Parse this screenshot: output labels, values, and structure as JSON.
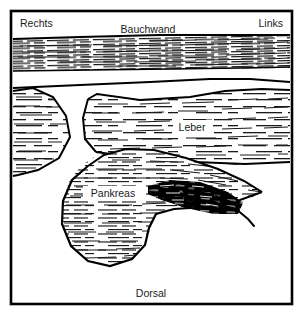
{
  "figure": {
    "kind": "anatomical-schematic",
    "language": "de",
    "colors": {
      "background": "#ffffff",
      "outline": "#000000",
      "hatch": "#1a1a1a",
      "mass_fill": "#000000",
      "text": "#1a1a1a"
    },
    "frame": {
      "x": 11,
      "y": 11,
      "width": 281,
      "height": 293,
      "stroke_width": 2.6
    }
  },
  "labels": {
    "orientation_right": "Rechts",
    "orientation_left": "Links",
    "top_structure": "Bauchwand",
    "bottom_structure": "Dorsal",
    "organ_liver": "Leber",
    "organ_pancreas": "Pankreas"
  },
  "label_positions": {
    "orientation_right": {
      "x": 20,
      "y": 24
    },
    "orientation_left": {
      "x": 283,
      "y": 24
    },
    "top_structure": {
      "x": 148,
      "y": 30
    },
    "bottom_structure": {
      "x": 151,
      "y": 294
    },
    "organ_liver": {
      "x": 192,
      "y": 128
    },
    "organ_pancreas": {
      "x": 113,
      "y": 194
    }
  },
  "regions": [
    {
      "id": "abdominal-wall-band",
      "name": "Bauchwand",
      "echo": "dense-horizontal-echoes",
      "path": "M 13,39 L 290,35 L 290,68 L 13,71 Z"
    },
    {
      "id": "subcutaneous-gap",
      "name": "Zwischenschicht",
      "echo": "anechoic",
      "path": "M 13,71 L 290,68 L 290,83 L 13,88 Z"
    },
    {
      "id": "liver-region",
      "name": "Leber",
      "echo": "medium-horizontal-echoes",
      "path": "M 88,99 L 97,94 L 140,100 L 190,97 L 225,91 L 260,89 L 290,91 L 290,162 L 240,165 L 180,161 L 130,158 L 98,152 L 86,140 L 83,120 Z"
    },
    {
      "id": "left-organ-region",
      "name": "Rechte Randstruktur",
      "echo": "medium-horizontal-echoes",
      "path": "M 13,91 L 32,88 L 52,96 L 66,115 L 70,136 L 60,157 L 40,169 L 20,174 L 13,175 Z"
    },
    {
      "id": "pancreas-region",
      "name": "Pankreas",
      "echo": "fine-horizontal-echoes",
      "path": "M 96,156 L 120,150 L 152,150 L 188,158 L 225,172 L 250,184 L 262,192 L 245,201 L 212,207 L 178,209 L 158,212 L 150,224 L 146,242 L 134,258 L 112,266 L 90,262 L 72,248 L 62,226 L 62,202 L 70,180 L 82,165 Z"
    },
    {
      "id": "pancreatic-mass",
      "name": "Raumforderung im Pankreas",
      "echo": "dense-dark-scribble",
      "path": "M 148,186 L 170,180 L 200,182 L 228,192 L 243,203 L 238,214 L 214,214 L 186,208 L 162,200 L 148,194 Z"
    }
  ],
  "contours": [
    {
      "id": "band-top-edge",
      "path": "M 13,39 L 80,37 L 160,35 L 230,35 L 290,35"
    },
    {
      "id": "band-bottom-edge",
      "path": "M 13,71 L 90,70 L 170,69 L 240,68 L 290,67"
    },
    {
      "id": "fascia-line",
      "path": "M 13,88 L 80,85 L 150,82 L 210,79 L 250,79 L 290,82"
    },
    {
      "id": "liver-upper-edge",
      "path": "M 88,99 L 97,94 L 140,100 L 190,97 L 225,91 L 262,89 L 290,90"
    },
    {
      "id": "liver-left-edge",
      "path": "M 88,99 L 83,118 L 85,139 L 96,152"
    },
    {
      "id": "liver-lower-edge",
      "path": "M 96,152 L 140,158 L 195,162 L 245,164 L 290,162"
    },
    {
      "id": "left-organ-edge",
      "path": "M 13,91 L 33,88 L 53,97 L 66,116 L 70,137 L 59,158 L 38,170 L 18,175 L 13,176"
    },
    {
      "id": "pancreas-outline",
      "path": "M 88,166 L 104,155 L 126,149 L 154,150 L 186,158 L 218,169 L 244,181 L 262,192"
    },
    {
      "id": "pancreas-lower",
      "path": "M 262,192 L 240,200 L 206,207 L 174,209 L 156,214 L 149,228 L 145,245 L 132,259 L 110,266 L 88,261 L 71,246 L 62,224 L 63,201 L 72,180 L 88,166"
    },
    {
      "id": "mass-tail-stroke",
      "path": "M 236,209 L 248,219 L 254,226"
    }
  ]
}
